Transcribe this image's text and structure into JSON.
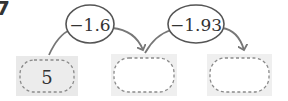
{
  "problem": {
    "number_mark": "7"
  },
  "diagram": {
    "start_value": "5",
    "operations": [
      {
        "label": "−1.6"
      },
      {
        "label": "−1.93"
      }
    ],
    "boxes": [
      {
        "value": "5"
      },
      {
        "value": ""
      },
      {
        "value": ""
      }
    ]
  },
  "colors": {
    "box_fill": "#e9e9e9",
    "box_inner_fill": "#f4f4f4",
    "dashed_border": "#8a8a8a",
    "arrow": "#777777",
    "oval_stroke": "#555555",
    "text": "#333333"
  }
}
